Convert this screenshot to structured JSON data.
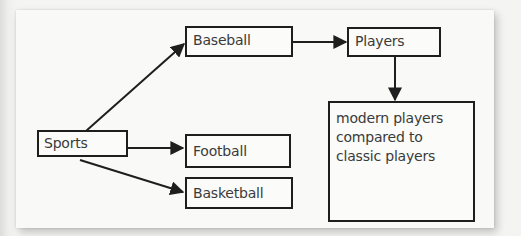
{
  "diagram": {
    "type": "concept-map",
    "nodes": {
      "sports": {
        "label": "Sports"
      },
      "baseball": {
        "label": "Baseball"
      },
      "football": {
        "label": "Football"
      },
      "basketball": {
        "label": "Basketball"
      },
      "players": {
        "label": "Players"
      },
      "comparison": {
        "lines": [
          "modern players",
          "compared to",
          "classic players"
        ]
      }
    },
    "edges": [
      {
        "from": "Sports",
        "to": "Baseball"
      },
      {
        "from": "Sports",
        "to": "Football"
      },
      {
        "from": "Sports",
        "to": "Basketball"
      },
      {
        "from": "Baseball",
        "to": "Players"
      },
      {
        "from": "Players",
        "to": "modern players compared to classic players"
      }
    ],
    "colors": {
      "stroke": "#1e1e1e",
      "text": "#3a3a3a",
      "paper": "#f9f9f7"
    }
  }
}
